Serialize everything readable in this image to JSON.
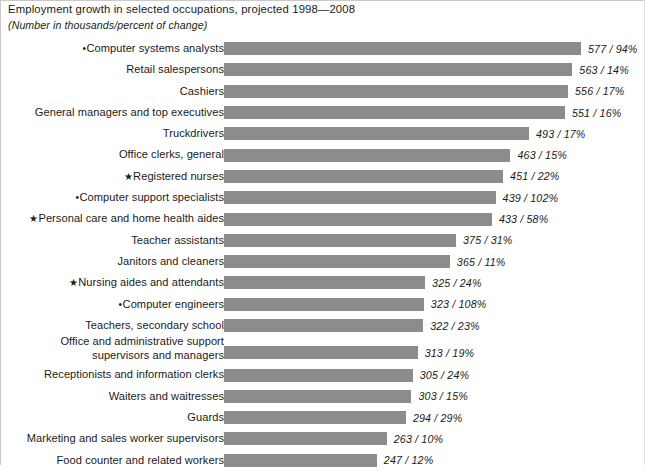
{
  "chart_data": {
    "type": "bar",
    "orientation": "horizontal",
    "title": "Employment growth in selected occupations, projected 1998—2008",
    "subtitle": "(Number in thousands/percent of change)",
    "xlabel": "",
    "ylabel": "",
    "grid": false,
    "legend": "none",
    "value_unit": "thousands",
    "xlim": [
      0,
      577
    ],
    "categories": [
      "Computer systems analysts",
      "Retail salespersons",
      "Cashiers",
      "General managers and top executives",
      "Truckdrivers",
      "Office clerks, general",
      "Registered nurses",
      "Computer support specialists",
      "Personal care and home health aides",
      "Teacher assistants",
      "Janitors and cleaners",
      "Nursing aides and attendants",
      "Computer engineers",
      "Teachers, secondary school",
      "Office and administrative support\nsupervisors and managers",
      "Receptionists and information clerks",
      "Waiters and waitresses",
      "Guards",
      "Marketing and sales worker supervisors",
      "Food counter and related workers"
    ],
    "values": [
      577,
      563,
      556,
      551,
      493,
      463,
      451,
      439,
      433,
      375,
      365,
      325,
      323,
      322,
      313,
      305,
      303,
      294,
      263,
      247
    ],
    "percent_change": [
      94,
      14,
      17,
      16,
      17,
      15,
      22,
      102,
      58,
      31,
      11,
      24,
      108,
      23,
      19,
      24,
      15,
      29,
      10,
      12
    ],
    "markers": [
      "bullet",
      "",
      "",
      "",
      "",
      "",
      "star",
      "bullet",
      "star",
      "",
      "",
      "star",
      "bullet",
      "",
      "",
      "",
      "",
      "",
      "",
      ""
    ],
    "bar_color": "#8c8c8c",
    "background_color": "#ffffff",
    "text_color": "#1a1a1a"
  },
  "rows": [
    {
      "label": "Computer systems analysts",
      "marker": "•",
      "value": 577,
      "percent": 94,
      "value_label": "577 / 94%"
    },
    {
      "label": "Retail salespersons",
      "marker": "",
      "value": 563,
      "percent": 14,
      "value_label": "563 / 14%"
    },
    {
      "label": "Cashiers",
      "marker": "",
      "value": 556,
      "percent": 17,
      "value_label": "556 / 17%"
    },
    {
      "label": "General managers and top executives",
      "marker": "",
      "value": 551,
      "percent": 16,
      "value_label": "551 / 16%"
    },
    {
      "label": "Truckdrivers",
      "marker": "",
      "value": 493,
      "percent": 17,
      "value_label": "493 / 17%"
    },
    {
      "label": "Office clerks, general",
      "marker": "",
      "value": 463,
      "percent": 15,
      "value_label": "463 / 15%"
    },
    {
      "label": "Registered nurses",
      "marker": "★",
      "value": 451,
      "percent": 22,
      "value_label": "451 / 22%"
    },
    {
      "label": "Computer support specialists",
      "marker": "•",
      "value": 439,
      "percent": 102,
      "value_label": "439 / 102%"
    },
    {
      "label": "Personal care and home health aides",
      "marker": "★",
      "value": 433,
      "percent": 58,
      "value_label": "433 / 58%"
    },
    {
      "label": "Teacher assistants",
      "marker": "",
      "value": 375,
      "percent": 31,
      "value_label": "375 / 31%"
    },
    {
      "label": "Janitors and cleaners",
      "marker": "",
      "value": 365,
      "percent": 11,
      "value_label": "365 / 11%"
    },
    {
      "label": "Nursing aides and attendants",
      "marker": "★",
      "value": 325,
      "percent": 24,
      "value_label": "325 / 24%"
    },
    {
      "label": "Computer engineers",
      "marker": "•",
      "value": 323,
      "percent": 108,
      "value_label": "323 / 108%"
    },
    {
      "label": "Teachers, secondary school",
      "marker": "",
      "value": 322,
      "percent": 23,
      "value_label": "322 / 23%"
    },
    {
      "label": "Office and administrative support\nsupervisors and managers",
      "marker": "",
      "value": 313,
      "percent": 19,
      "value_label": "313 / 19%"
    },
    {
      "label": "Receptionists and information clerks",
      "marker": "",
      "value": 305,
      "percent": 24,
      "value_label": "305 / 24%"
    },
    {
      "label": "Waiters and waitresses",
      "marker": "",
      "value": 303,
      "percent": 15,
      "value_label": "303 / 15%"
    },
    {
      "label": "Guards",
      "marker": "",
      "value": 294,
      "percent": 29,
      "value_label": "294 / 29%"
    },
    {
      "label": "Marketing and sales worker supervisors",
      "marker": "",
      "value": 263,
      "percent": 10,
      "value_label": "263 / 10%"
    },
    {
      "label": "Food counter and related workers",
      "marker": "",
      "value": 247,
      "percent": 12,
      "value_label": "247 / 12%"
    }
  ]
}
